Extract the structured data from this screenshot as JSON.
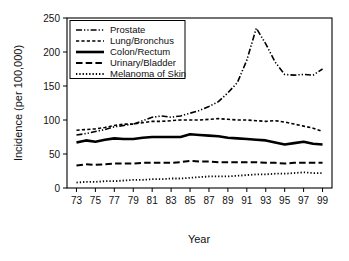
{
  "chart_data": {
    "type": "line",
    "title": "",
    "xlabel": "Year",
    "ylabel": "Incidence (per 100,000)",
    "xlim": [
      1972,
      2000
    ],
    "ylim": [
      0,
      250
    ],
    "yticks": [
      0,
      50,
      100,
      150,
      200,
      250
    ],
    "ytick_labels": [
      "0",
      "50",
      "100",
      "150",
      "200",
      "250"
    ],
    "xticks": [
      1973,
      1975,
      1977,
      1979,
      1981,
      1983,
      1985,
      1987,
      1989,
      1991,
      1993,
      1995,
      1997,
      1999
    ],
    "xtick_labels": [
      "73",
      "75",
      "77",
      "79",
      "81",
      "83",
      "85",
      "87",
      "89",
      "91",
      "93",
      "95",
      "97",
      "99"
    ],
    "grid": false,
    "legend_position": "upper-left",
    "x": [
      1973,
      1974,
      1975,
      1976,
      1977,
      1978,
      1979,
      1980,
      1981,
      1982,
      1983,
      1984,
      1985,
      1986,
      1987,
      1988,
      1989,
      1990,
      1991,
      1992,
      1993,
      1994,
      1995,
      1996,
      1997,
      1998,
      1999
    ],
    "series": [
      {
        "name": "Prostate",
        "dash": "dash-dot-dot",
        "width": 1.6,
        "values": [
          78,
          80,
          83,
          86,
          90,
          92,
          94,
          99,
          104,
          106,
          104,
          106,
          110,
          114,
          120,
          127,
          140,
          155,
          188,
          235,
          212,
          185,
          167,
          166,
          167,
          166,
          175
        ]
      },
      {
        "name": "Lung/Bronchus",
        "dash": "dashed-short",
        "width": 1.6,
        "values": [
          85,
          86,
          87,
          89,
          92,
          94,
          94,
          96,
          98,
          98,
          99,
          100,
          100,
          100,
          101,
          102,
          101,
          100,
          100,
          99,
          98,
          99,
          97,
          94,
          91,
          88,
          83
        ]
      },
      {
        "name": "Colon/Rectum",
        "dash": "solid",
        "width": 2.6,
        "values": [
          67,
          70,
          68,
          71,
          73,
          72,
          72,
          74,
          75,
          75,
          75,
          75,
          79,
          78,
          77,
          76,
          74,
          73,
          72,
          71,
          70,
          67,
          64,
          66,
          68,
          65,
          64
        ]
      },
      {
        "name": "Urinary/Bladder",
        "dash": "dashed-long",
        "width": 2.0,
        "values": [
          33,
          35,
          34,
          35,
          36,
          36,
          36,
          37,
          37,
          37,
          37,
          38,
          40,
          39,
          39,
          38,
          38,
          38,
          38,
          38,
          37,
          37,
          36,
          37,
          37,
          37,
          37
        ]
      },
      {
        "name": "Melanoma of Skin",
        "dash": "dotted",
        "width": 1.8,
        "values": [
          8,
          9,
          9,
          10,
          10,
          11,
          12,
          12,
          13,
          13,
          14,
          14,
          15,
          16,
          17,
          17,
          17,
          18,
          19,
          20,
          20,
          21,
          21,
          22,
          23,
          22,
          22
        ]
      }
    ]
  },
  "legend": {
    "items": [
      {
        "label": "Prostate"
      },
      {
        "label": "Lung/Bronchus"
      },
      {
        "label": "Colon/Rectum"
      },
      {
        "label": "Urinary/Bladder"
      },
      {
        "label": "Melanoma of Skin"
      }
    ]
  },
  "colors": {
    "line": "#000000",
    "background": "#ffffff",
    "text": "#111111"
  }
}
